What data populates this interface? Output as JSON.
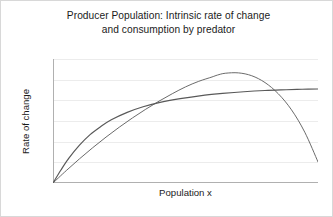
{
  "chart_data": {
    "type": "line",
    "title": "Producer Population: Intrinsic rate of change and consumption by predator",
    "title_lines": [
      "Producer Population: Intrinsic rate of change",
      "and consumption by predator"
    ],
    "xlabel": "Population x",
    "ylabel": "Rate of change",
    "xlim": [
      0,
      1
    ],
    "ylim": [
      0,
      1
    ],
    "grid": true,
    "grid_horizontal_lines": 6,
    "grid_color": "#ececec",
    "axis_color": "#b0b0b0",
    "legend": null,
    "xticks": [],
    "yticks": [],
    "series": [
      {
        "name": "Intrinsic rate of change",
        "shape": "parabola",
        "color": "#6b6b6b",
        "width": 1,
        "description": "Logistic growth rate rising from origin to a maximum near mid-population then falling back to zero at carrying capacity",
        "points": [
          [
            0.0,
            0.0
          ],
          [
            0.05,
            0.1
          ],
          [
            0.1,
            0.195
          ],
          [
            0.15,
            0.285
          ],
          [
            0.2,
            0.37
          ],
          [
            0.25,
            0.45
          ],
          [
            0.3,
            0.525
          ],
          [
            0.35,
            0.595
          ],
          [
            0.4,
            0.66
          ],
          [
            0.45,
            0.72
          ],
          [
            0.5,
            0.775
          ],
          [
            0.55,
            0.82
          ],
          [
            0.6,
            0.855
          ],
          [
            0.62,
            0.87
          ],
          [
            0.65,
            0.885
          ],
          [
            0.7,
            0.888
          ],
          [
            0.75,
            0.865
          ],
          [
            0.8,
            0.81
          ],
          [
            0.85,
            0.72
          ],
          [
            0.9,
            0.59
          ],
          [
            0.95,
            0.41
          ],
          [
            1.0,
            0.17
          ]
        ]
      },
      {
        "name": "Consumption by predator",
        "shape": "saturating",
        "color": "#595959",
        "width": 1.2,
        "description": "Holling type II functional response rising steeply at low population and saturating toward a plateau",
        "points": [
          [
            0.0,
            0.0
          ],
          [
            0.03,
            0.105
          ],
          [
            0.06,
            0.2
          ],
          [
            0.1,
            0.305
          ],
          [
            0.14,
            0.39
          ],
          [
            0.18,
            0.455
          ],
          [
            0.22,
            0.51
          ],
          [
            0.28,
            0.57
          ],
          [
            0.34,
            0.615
          ],
          [
            0.4,
            0.648
          ],
          [
            0.48,
            0.68
          ],
          [
            0.56,
            0.705
          ],
          [
            0.64,
            0.722
          ],
          [
            0.72,
            0.736
          ],
          [
            0.8,
            0.746
          ],
          [
            0.88,
            0.752
          ],
          [
            0.94,
            0.756
          ],
          [
            1.0,
            0.758
          ]
        ]
      }
    ],
    "intersections": [
      [
        0.305,
        0.563
      ],
      [
        0.86,
        0.75
      ]
    ]
  }
}
